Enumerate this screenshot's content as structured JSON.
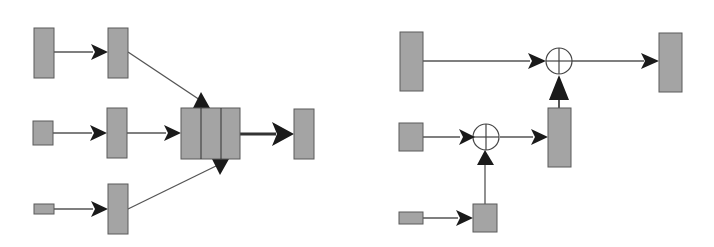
{
  "diagram": {
    "colors": {
      "box_fill": "#a4a4a4",
      "box_stroke": "#5a5a5a",
      "line": "#555555",
      "arrow": "#1a1a1a",
      "background": "#ffffff"
    },
    "left": {
      "description": "Three inputs of decreasing size each mapped to a feature block, then concatenated and projected to output",
      "inputs": [
        {
          "id": "L-in-1",
          "x": 34,
          "y": 28,
          "w": 20,
          "h": 50
        },
        {
          "id": "L-in-2",
          "x": 33,
          "y": 121,
          "w": 20,
          "h": 24
        },
        {
          "id": "L-in-3",
          "x": 34,
          "y": 204,
          "w": 20,
          "h": 10
        }
      ],
      "features": [
        {
          "id": "L-feat-1",
          "x": 108,
          "y": 28,
          "w": 20,
          "h": 50
        },
        {
          "id": "L-feat-2",
          "x": 107,
          "y": 108,
          "w": 20,
          "h": 50
        },
        {
          "id": "L-feat-3",
          "x": 108,
          "y": 184,
          "w": 20,
          "h": 50
        }
      ],
      "concat": {
        "id": "L-concat",
        "x": 181,
        "y": 108,
        "w": 59,
        "h": 51,
        "segments": 3
      },
      "output": {
        "id": "L-out",
        "x": 294,
        "y": 109,
        "w": 20,
        "h": 50
      }
    },
    "right": {
      "description": "Residual-style fusion: small inputs merged via sum nodes and added to the large input path",
      "boxes": [
        {
          "id": "R-in-1",
          "x": 400,
          "y": 32,
          "w": 23,
          "h": 59
        },
        {
          "id": "R-out",
          "x": 659,
          "y": 33,
          "w": 23,
          "h": 59
        },
        {
          "id": "R-in-2",
          "x": 399,
          "y": 123,
          "w": 24,
          "h": 28
        },
        {
          "id": "R-mid",
          "x": 548,
          "y": 108,
          "w": 23,
          "h": 59
        },
        {
          "id": "R-in-3",
          "x": 399,
          "y": 212,
          "w": 24,
          "h": 12
        },
        {
          "id": "R-up-3",
          "x": 473,
          "y": 204,
          "w": 24,
          "h": 28
        }
      ],
      "sum_nodes": [
        {
          "id": "R-sum-top",
          "cx": 559,
          "cy": 61,
          "r": 13
        },
        {
          "id": "R-sum-bottom",
          "cx": 487,
          "cy": 137,
          "r": 13
        }
      ]
    }
  }
}
